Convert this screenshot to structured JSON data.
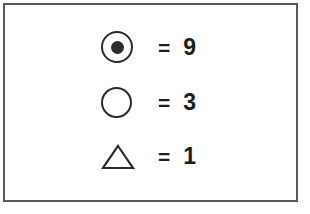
{
  "panel": {
    "background_color": "#ffffff",
    "border_color": "#5a5a5e"
  },
  "legend": {
    "equals_symbol": "=",
    "ink_color": "#2b2b2b",
    "rows": [
      {
        "symbol_name": "bullseye-circle-with-dot",
        "equals": "=",
        "value": "9"
      },
      {
        "symbol_name": "hollow-circle",
        "equals": "=",
        "value": "3"
      },
      {
        "symbol_name": "hollow-triangle",
        "equals": "=",
        "value": "1"
      }
    ]
  }
}
